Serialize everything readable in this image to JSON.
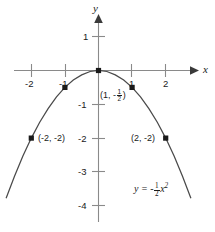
{
  "chart_data": {
    "type": "line",
    "title": "",
    "equation_label": "y = -1/2 x^2",
    "xlabel": "x",
    "ylabel": "y",
    "xlim": [
      -2.9,
      2.9
    ],
    "ylim": [
      -4.4,
      1.4
    ],
    "grid": false,
    "legend": "none",
    "x_ticks": [
      -2,
      -1,
      1,
      2
    ],
    "x_tick_labels": [
      "-2",
      "-1",
      "1",
      "2"
    ],
    "y_ticks": [
      1,
      -1,
      -2,
      -3,
      -4
    ],
    "y_tick_labels": [
      "1",
      "-1",
      "-2",
      "-3",
      "-4"
    ],
    "series": [
      {
        "name": "y = -1/2 x^2",
        "x": [
          -2.75,
          -2.5,
          -2.25,
          -2,
          -1.75,
          -1.5,
          -1.25,
          -1,
          -0.75,
          -0.5,
          -0.25,
          0,
          0.25,
          0.5,
          0.75,
          1,
          1.25,
          1.5,
          1.75,
          2,
          2.25,
          2.5,
          2.75
        ],
        "y": [
          -3.78,
          -3.13,
          -2.53,
          -2,
          -1.53,
          -1.13,
          -0.78,
          -0.5,
          -0.28,
          -0.13,
          -0.03,
          0,
          -0.03,
          -0.13,
          -0.28,
          -0.5,
          -0.78,
          -1.13,
          -1.53,
          -2,
          -2.53,
          -3.13,
          -3.78
        ]
      }
    ],
    "marked_points": [
      {
        "x": -2,
        "y": -2,
        "label": "(-2, -2)"
      },
      {
        "x": -1,
        "y": -0.5,
        "label": ""
      },
      {
        "x": 0,
        "y": 0,
        "label": ""
      },
      {
        "x": 1,
        "y": -0.5,
        "label": "(1, -1/2)"
      },
      {
        "x": 2,
        "y": -2,
        "label": "(2, -2)"
      }
    ],
    "annotations": [
      {
        "text": "(1, -1/2)",
        "x": 1,
        "y": -0.5
      },
      {
        "text": "(-2, -2)",
        "x": -2,
        "y": -2
      },
      {
        "text": "(2, -2)",
        "x": 2,
        "y": -2
      },
      {
        "text": "y = -1/2 x^2",
        "x": 1.6,
        "y": -3.4
      }
    ],
    "colors": {
      "background": "#ffffff",
      "axis": "#8a8a8a",
      "curve": "#4a4a4a",
      "marker": "#1a1a1a",
      "text": "#1a1a1a"
    }
  },
  "labels": {
    "x_axis": "x",
    "y_axis": "y",
    "tick_x_neg2": "-2",
    "tick_x_neg1": "-1",
    "tick_x_pos1": "1",
    "tick_x_pos2": "2",
    "tick_y_pos1": "1",
    "tick_y_neg1": "-1",
    "tick_y_neg2": "-2",
    "tick_y_neg3": "-3",
    "tick_y_neg4": "-4",
    "point_label_neg2": "(-2, -2)",
    "point_label_pos2": "(2, -2)",
    "point_label_one_open": "(1, -",
    "point_label_one_close": ")",
    "eqn_lead": "y = -",
    "eqn_var": "x",
    "eqn_exp": "2",
    "frac_num": "1",
    "frac_den": "2"
  }
}
